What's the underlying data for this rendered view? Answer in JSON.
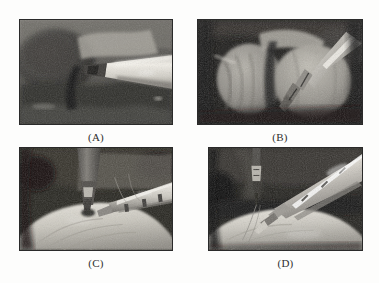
{
  "figure": {
    "layout": "2x2-grid",
    "background_color": "#fdfdfc",
    "caption_color": "#2e2e2e",
    "border_color": "#2a2a2a",
    "panels": [
      {
        "id": "A",
        "caption": "(A)",
        "alt": "Grayscale laparoscopic view: a bright metallic instrument shaft enters from the right and meets dark tissue at center-left.",
        "palette": {
          "darkest": "#1a1a1a",
          "dark": "#3d3d3d",
          "mid": "#787878",
          "light": "#b8b6b0",
          "highlight": "#ece9e2"
        }
      },
      {
        "id": "B",
        "caption": "(B)",
        "alt": "Grayscale laparoscopic view: two rounded tissue masses separated by a cleft, with a jawed grasper descending from the upper right.",
        "palette": {
          "darkest": "#0f0f0f",
          "dark": "#2e2e2e",
          "mid": "#6e6c68",
          "light": "#a9a69f",
          "highlight": "#d8d5cd"
        }
      },
      {
        "id": "C",
        "caption": "(C)",
        "alt": "Grayscale laparoscopic view: a vertical instrument from the top and an angled instrument from the right above a pale dome of tissue.",
        "palette": {
          "darkest": "#141414",
          "dark": "#343434",
          "mid": "#6f6d68",
          "light": "#bdbab2",
          "highlight": "#efece5"
        }
      },
      {
        "id": "D",
        "caption": "(D)",
        "alt": "Grayscale laparoscopic view: a bright instrument enters from the upper right toward a thin instrument at upper left, above a pale tissue dome.",
        "palette": {
          "darkest": "#101010",
          "dark": "#303030",
          "mid": "#6b6964",
          "light": "#bcb9b1",
          "highlight": "#f2efe8"
        }
      }
    ]
  }
}
